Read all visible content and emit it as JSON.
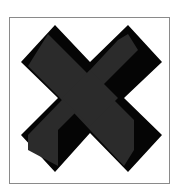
{
  "icon": {
    "name": "close-x-icon",
    "colors": {
      "face": "#2b2b2b",
      "shadow": "#050505",
      "frame_border": "#8a8a8a",
      "background": "#ffffff"
    }
  }
}
